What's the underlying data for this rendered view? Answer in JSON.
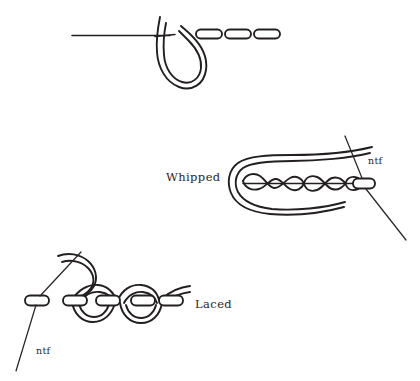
{
  "figure": {
    "background_color": "#ffffff",
    "ink_color": "#231f20",
    "width": 420,
    "height": 381,
    "panels": [
      {
        "id": "running-stitch",
        "label": "",
        "description": "Running stitch base row with needle thread loop and three stitch dashes",
        "stitch_dash_count": 3
      },
      {
        "id": "whipped",
        "label": "Whipped",
        "description": "Thread whipped in a spiral around a running stitch row, needle passing through fabric at right",
        "needle_marker": "ntf"
      },
      {
        "id": "laced",
        "label": "Laced",
        "description": "Thread laced alternately up and down through a row of running stitches, needle entering fabric at left",
        "needle_marker": "ntf"
      }
    ]
  },
  "labels": {
    "whipped": "Whipped",
    "laced": "Laced",
    "ntf_whipped": "ntf",
    "ntf_laced": "ntf"
  }
}
